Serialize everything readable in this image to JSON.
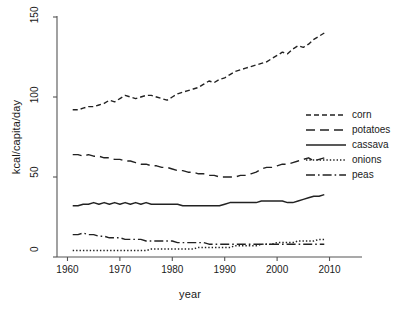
{
  "chart_data": {
    "type": "line",
    "title": "",
    "xlabel": "year",
    "ylabel": "kcal/capita/day",
    "xlim": [
      1958,
      2012
    ],
    "ylim": [
      0,
      150
    ],
    "xticks": [
      1960,
      1970,
      1980,
      1990,
      2000,
      2010
    ],
    "yticks": [
      0,
      50,
      100,
      150
    ],
    "grid": false,
    "legend_position": "right",
    "x": [
      1961,
      1962,
      1963,
      1964,
      1965,
      1966,
      1967,
      1968,
      1969,
      1970,
      1971,
      1972,
      1973,
      1974,
      1975,
      1976,
      1977,
      1978,
      1979,
      1980,
      1981,
      1982,
      1983,
      1984,
      1985,
      1986,
      1987,
      1988,
      1989,
      1990,
      1991,
      1992,
      1993,
      1994,
      1995,
      1996,
      1997,
      1998,
      1999,
      2000,
      2001,
      2002,
      2003,
      2004,
      2005,
      2006,
      2007,
      2008,
      2009
    ],
    "series": [
      {
        "name": "corn",
        "style": "dashed",
        "values": [
          92,
          92,
          93,
          94,
          94,
          95,
          96,
          98,
          97,
          99,
          101,
          100,
          99,
          100,
          101,
          101,
          100,
          99,
          98,
          100,
          102,
          103,
          104,
          105,
          106,
          108,
          110,
          109,
          111,
          112,
          114,
          116,
          117,
          118,
          119,
          120,
          121,
          122,
          124,
          126,
          128,
          127,
          130,
          132,
          131,
          133,
          136,
          138,
          140
        ]
      },
      {
        "name": "potatoes",
        "style": "long-dash",
        "values": [
          64,
          64,
          63,
          64,
          63,
          63,
          62,
          62,
          61,
          61,
          60,
          60,
          59,
          58,
          58,
          57,
          57,
          56,
          56,
          55,
          54,
          54,
          53,
          53,
          52,
          52,
          51,
          51,
          50,
          50,
          50,
          50,
          51,
          51,
          52,
          53,
          55,
          56,
          56,
          57,
          58,
          58,
          59,
          60,
          61,
          62,
          60,
          61,
          62
        ]
      },
      {
        "name": "cassava",
        "style": "solid",
        "values": [
          32,
          32,
          33,
          33,
          34,
          33,
          34,
          33,
          34,
          33,
          34,
          33,
          34,
          33,
          34,
          33,
          33,
          33,
          33,
          33,
          33,
          32,
          32,
          32,
          32,
          32,
          32,
          32,
          32,
          33,
          34,
          34,
          34,
          34,
          34,
          34,
          35,
          35,
          35,
          35,
          35,
          34,
          34,
          35,
          36,
          37,
          38,
          38,
          39
        ]
      },
      {
        "name": "onions",
        "style": "dotted",
        "values": [
          4,
          4,
          4,
          4,
          4,
          4,
          4,
          4,
          4,
          4,
          4,
          4,
          4,
          4,
          4,
          5,
          5,
          5,
          5,
          5,
          5,
          5,
          5,
          5,
          6,
          6,
          6,
          6,
          6,
          6,
          6,
          7,
          7,
          7,
          7,
          7,
          8,
          8,
          8,
          9,
          9,
          9,
          9,
          10,
          10,
          10,
          10,
          11,
          11
        ]
      },
      {
        "name": "peas",
        "style": "dash-dot",
        "values": [
          14,
          14,
          15,
          14,
          14,
          13,
          13,
          12,
          12,
          12,
          11,
          11,
          11,
          11,
          10,
          10,
          10,
          10,
          10,
          10,
          9,
          9,
          9,
          9,
          9,
          9,
          8,
          8,
          8,
          8,
          8,
          8,
          8,
          8,
          8,
          8,
          8,
          8,
          8,
          8,
          8,
          8,
          8,
          8,
          8,
          8,
          8,
          8,
          8
        ]
      }
    ]
  },
  "legend": {
    "items": [
      {
        "label": "corn"
      },
      {
        "label": "potatoes"
      },
      {
        "label": "cassava"
      },
      {
        "label": "onions"
      },
      {
        "label": "peas"
      }
    ]
  },
  "colors": {
    "line": "#222222",
    "axis": "#555555",
    "text": "#1a1a1a",
    "background": "#ffffff"
  }
}
